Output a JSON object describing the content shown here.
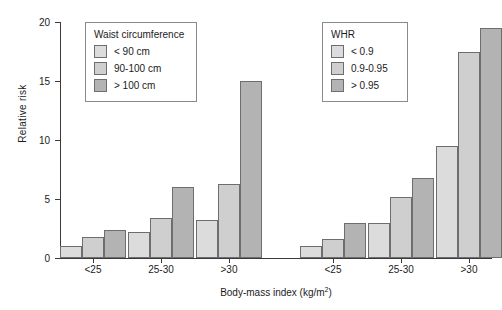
{
  "chart_data": {
    "type": "bar",
    "title": "",
    "xlabel": "Body-mass index (kg/m²)",
    "ylabel": "Relative risk",
    "ylim": [
      0,
      20
    ],
    "yticks": [
      0,
      5,
      10,
      15,
      20
    ],
    "grid": false,
    "panels": [
      {
        "name": "Waist circumference",
        "legend_position": "upper-left-inside",
        "categories": [
          "<25",
          "25-30",
          ">30"
        ],
        "series": [
          {
            "name": "< 90 cm",
            "values": [
              1.0,
              2.2,
              3.2
            ]
          },
          {
            "name": "90-100 cm",
            "values": [
              1.8,
              3.4,
              6.3
            ]
          },
          {
            "name": "> 100 cm",
            "values": [
              2.4,
              6.0,
              15.0
            ]
          }
        ]
      },
      {
        "name": "WHR",
        "legend_position": "upper-middle-inside",
        "categories": [
          "<25",
          "25-30",
          ">30"
        ],
        "series": [
          {
            "name": "< 0.9",
            "values": [
              1.0,
              3.0,
              9.5
            ]
          },
          {
            "name": "0.9-0.95",
            "values": [
              1.6,
              5.2,
              17.5
            ]
          },
          {
            "name": "> 0.95",
            "values": [
              3.0,
              6.8,
              19.5
            ]
          }
        ]
      }
    ],
    "series_colors": [
      "#dcdcdc",
      "#cfcfcf",
      "#b3b3b3"
    ]
  },
  "axes": {
    "y_title": "Relative risk",
    "x_title_main": "Body-mass index (kg/m",
    "x_title_sup": "2",
    "x_title_tail": ")",
    "y_tick_labels": [
      "20",
      "15",
      "10",
      "5",
      "0"
    ]
  },
  "legends": [
    {
      "id": "waist",
      "title": "Waist circumference",
      "items": [
        {
          "label": "< 90 cm",
          "color": "#dcdcdc"
        },
        {
          "label": "90-100 cm",
          "color": "#cfcfcf"
        },
        {
          "label": "> 100 cm",
          "color": "#b3b3b3"
        }
      ]
    },
    {
      "id": "whr",
      "title": "WHR",
      "items": [
        {
          "label": "< 0.9",
          "color": "#dcdcdc"
        },
        {
          "label": "0.9-0.95",
          "color": "#cfcfcf"
        },
        {
          "label": "> 0.95",
          "color": "#b3b3b3"
        }
      ]
    }
  ],
  "group_labels": [
    "<25",
    "25-30",
    ">30",
    "<25",
    "25-30",
    ">30"
  ]
}
